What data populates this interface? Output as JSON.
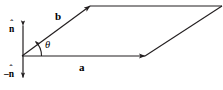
{
  "figure": {
    "type": "vector-cross-product-parallelogram",
    "width": 223,
    "height": 90,
    "background_color": "#ffffff",
    "stroke_color": "#231f20",
    "text_color": "#000000"
  },
  "labels": {
    "vector_a": "a",
    "vector_b": "b",
    "angle_theta": "θ",
    "normal_up_base": "n",
    "normal_up_hat": "ˆ",
    "normal_down_base": "–n",
    "normal_down_hat": "ˆ"
  },
  "geometry": {
    "origin": {
      "x": 22,
      "y": 56
    },
    "vector_a_tip": {
      "x": 145,
      "y": 56
    },
    "vector_b_tip": {
      "x": 90,
      "y": 6
    },
    "parallelogram_far_corner": {
      "x": 222,
      "y": 6
    },
    "normal_axis_x": 23,
    "normal_axis_top_y": 25,
    "normal_axis_bottom_y": 78,
    "theta_arc_radius": 19
  },
  "annotations": {
    "description": "Parallelogram spanned by vectors a and b with included angle theta and unit normal n-hat shown pointing up and minus n-hat pointing down."
  }
}
